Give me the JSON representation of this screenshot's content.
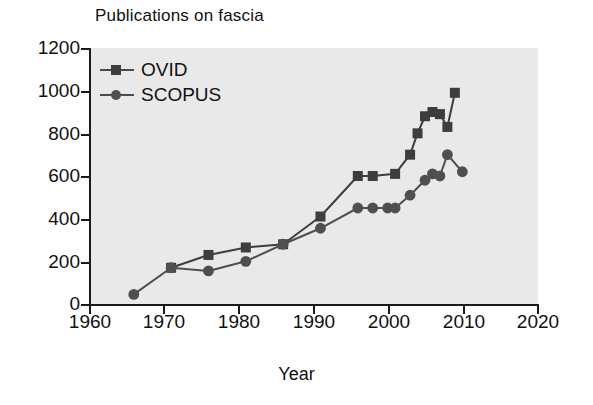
{
  "chart_data": {
    "type": "line",
    "title": "Publications on fascia",
    "xlabel": "Year",
    "ylabel": "",
    "xlim": [
      1960,
      2020
    ],
    "ylim": [
      0,
      1200
    ],
    "xticks": [
      1960,
      1970,
      1980,
      1990,
      2000,
      2010,
      2020
    ],
    "yticks": [
      0,
      200,
      400,
      600,
      800,
      1000,
      1200
    ],
    "grid": false,
    "legend_position": "top-left",
    "series": [
      {
        "name": "OVID",
        "marker": "square",
        "color": "#3d3d3d",
        "x": [
          1971,
          1976,
          1981,
          1986,
          1991,
          1996,
          1998,
          2001,
          2003,
          2004,
          2005,
          2006,
          2007,
          2008,
          2009
        ],
        "y": [
          170,
          230,
          265,
          280,
          410,
          600,
          600,
          610,
          700,
          800,
          880,
          900,
          890,
          830,
          990
        ]
      },
      {
        "name": "SCOPUS",
        "marker": "circle",
        "color": "#4f4f4f",
        "x": [
          1966,
          1971,
          1976,
          1981,
          1986,
          1991,
          1996,
          1998,
          2000,
          2001,
          2003,
          2005,
          2006,
          2007,
          2008,
          2010
        ],
        "y": [
          45,
          170,
          155,
          200,
          280,
          355,
          450,
          450,
          450,
          450,
          510,
          580,
          610,
          600,
          700,
          620
        ]
      }
    ]
  },
  "legend": {
    "items": [
      {
        "label": "OVID"
      },
      {
        "label": "SCOPUS"
      }
    ]
  },
  "axes": {
    "x_tick_labels": [
      "1960",
      "1970",
      "1980",
      "1990",
      "2000",
      "2010",
      "2020"
    ],
    "y_tick_labels": [
      "0",
      "200",
      "400",
      "600",
      "800",
      "1000",
      "1200"
    ]
  },
  "colors": {
    "plot_background": "#e9e9e9",
    "axis": "#1a1a1a",
    "ovid": "#3d3d3d",
    "scopus": "#4f4f4f",
    "text": "#111111",
    "page_background": "#ffffff"
  }
}
